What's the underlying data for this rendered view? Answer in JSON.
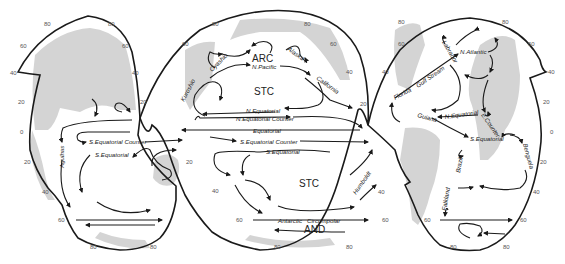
{
  "figure": {
    "type": "interrupted world map of ocean surface currents",
    "colors": {
      "outline": "#1a1a1a",
      "land": "#d4d4d4",
      "background": "#ffffff"
    }
  },
  "regions": {
    "arc": "ARC",
    "stc_north": "STC",
    "stc_south": "STC",
    "and": "AND"
  },
  "currents": {
    "kuroshio": "Kuroshio",
    "oyashio": "Oyashio",
    "alaska": "Alaska",
    "n_pacific": "N.Pacific",
    "california": "California",
    "n_equatorial_pac": "N.Equatorial",
    "n_equatorial_counter": "N.Equatorial Counter",
    "equatorial": "Equatorial",
    "s_equatorial_counter_pac": "S.Equatorial Counter",
    "s_equatorial_pac": "S.Equatorial",
    "humboldt": "Humboldt",
    "antarctic": "Antarctic",
    "circumpolar": "Circumpolar",
    "s_equatorial_counter_ind": "S.Equatorial Counter",
    "s_equatorial_ind": "S.Equatorial",
    "agulhas": "Agulhas",
    "labrador": "Labrador",
    "n_atlantic": "N.Atlantic",
    "florida": "Florida",
    "gulf_stream": "Gulf Stream",
    "guiana": "Guiana",
    "n_equatorial_atl": "N.Equatorial",
    "e_counter": "E.Counter",
    "s_equatorial_atl": "S.Equatorial",
    "benguela": "Benguela",
    "brazil": "Brazil",
    "falkland": "Falkland"
  },
  "latitude_ticks": {
    "t80": "80",
    "t60": "60",
    "t40": "40",
    "t20": "20",
    "t0": "0"
  }
}
